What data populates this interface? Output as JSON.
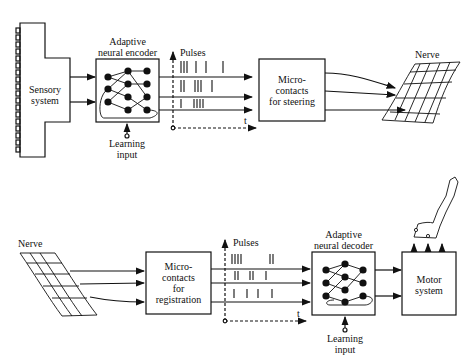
{
  "top": {
    "sensory": "Sensory\nsystem",
    "encoder_title_1": "Adaptive",
    "encoder_title_2": "neural encoder",
    "learning_1": "Learning",
    "learning_2": "input",
    "pulses": "Pulses",
    "t": "t",
    "micro_1": "Micro-",
    "micro_2": "contacts",
    "micro_3": "for steering",
    "nerve": "Nerve"
  },
  "bottom": {
    "nerve": "Nerve",
    "micro_1": "Micro-",
    "micro_2": "contacts",
    "micro_3": "for",
    "micro_4": "registration",
    "pulses": "Pulses",
    "t": "t",
    "decoder_title_1": "Adaptive",
    "decoder_title_2": "neural decoder",
    "learning_1": "Learning",
    "learning_2": "input",
    "motor_1": "Motor",
    "motor_2": "system"
  }
}
